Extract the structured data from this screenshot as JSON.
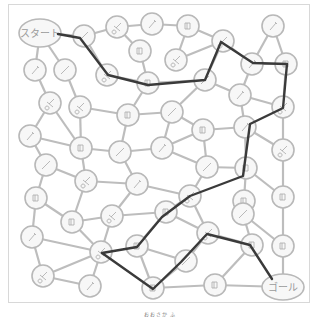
{
  "labels": {
    "start": "スタート",
    "goal": "ゴール",
    "caption": "おおさか ふ"
  },
  "colors": {
    "edge": "#bdbdbd",
    "node_stroke": "#b8b8b8",
    "node_fill": "#f7f7f7",
    "path": "#3a3a3a",
    "label": "#9a9a9a"
  },
  "start_node": {
    "x": 40,
    "y": 33,
    "rx": 21,
    "ry": 14
  },
  "goal_node": {
    "x": 283,
    "y": 287,
    "rx": 21,
    "ry": 13
  },
  "nodes": [
    {
      "id": 0,
      "x": 84,
      "y": 36,
      "icon": "pencil"
    },
    {
      "id": 1,
      "x": 117,
      "y": 27,
      "icon": "scissors"
    },
    {
      "id": 2,
      "x": 152,
      "y": 24,
      "icon": "pen"
    },
    {
      "id": 3,
      "x": 188,
      "y": 26,
      "icon": "book"
    },
    {
      "id": 4,
      "x": 140,
      "y": 51,
      "icon": "book"
    },
    {
      "id": 5,
      "x": 176,
      "y": 60,
      "icon": "scissors"
    },
    {
      "id": 6,
      "x": 223,
      "y": 41,
      "icon": "scissors"
    },
    {
      "id": 7,
      "x": 273,
      "y": 26,
      "icon": "pen"
    },
    {
      "id": 8,
      "x": 252,
      "y": 64,
      "icon": "pen"
    },
    {
      "id": 9,
      "x": 286,
      "y": 64,
      "icon": "book"
    },
    {
      "id": 10,
      "x": 35,
      "y": 70,
      "icon": "pen"
    },
    {
      "id": 11,
      "x": 65,
      "y": 70,
      "icon": "pencil"
    },
    {
      "id": 12,
      "x": 107,
      "y": 75,
      "icon": "scissors"
    },
    {
      "id": 13,
      "x": 148,
      "y": 83,
      "icon": "book"
    },
    {
      "id": 14,
      "x": 205,
      "y": 80,
      "icon": "pencil"
    },
    {
      "id": 15,
      "x": 240,
      "y": 95,
      "icon": "pen"
    },
    {
      "id": 16,
      "x": 283,
      "y": 107,
      "icon": "scissors"
    },
    {
      "id": 17,
      "x": 50,
      "y": 103,
      "icon": "scissors"
    },
    {
      "id": 18,
      "x": 80,
      "y": 107,
      "icon": "scissors"
    },
    {
      "id": 19,
      "x": 128,
      "y": 115,
      "icon": "book"
    },
    {
      "id": 20,
      "x": 172,
      "y": 112,
      "icon": "pencil"
    },
    {
      "id": 21,
      "x": 30,
      "y": 136,
      "icon": "pen"
    },
    {
      "id": 22,
      "x": 81,
      "y": 148,
      "icon": "book"
    },
    {
      "id": 23,
      "x": 120,
      "y": 152,
      "icon": "pencil"
    },
    {
      "id": 24,
      "x": 162,
      "y": 148,
      "icon": "pen"
    },
    {
      "id": 25,
      "x": 203,
      "y": 130,
      "icon": "book"
    },
    {
      "id": 26,
      "x": 245,
      "y": 127,
      "icon": "pen"
    },
    {
      "id": 27,
      "x": 283,
      "y": 150,
      "icon": "scissors"
    },
    {
      "id": 28,
      "x": 46,
      "y": 165,
      "icon": "pencil"
    },
    {
      "id": 29,
      "x": 86,
      "y": 181,
      "icon": "scissors"
    },
    {
      "id": 30,
      "x": 137,
      "y": 184,
      "icon": "pen"
    },
    {
      "id": 31,
      "x": 207,
      "y": 167,
      "icon": "pencil"
    },
    {
      "id": 32,
      "x": 246,
      "y": 168,
      "icon": "book"
    },
    {
      "id": 33,
      "x": 36,
      "y": 198,
      "icon": "book"
    },
    {
      "id": 34,
      "x": 190,
      "y": 196,
      "icon": "scissors"
    },
    {
      "id": 35,
      "x": 244,
      "y": 201,
      "icon": "book"
    },
    {
      "id": 36,
      "x": 283,
      "y": 197,
      "icon": "book"
    },
    {
      "id": 37,
      "x": 72,
      "y": 222,
      "icon": "book"
    },
    {
      "id": 38,
      "x": 112,
      "y": 216,
      "icon": "scissors"
    },
    {
      "id": 39,
      "x": 166,
      "y": 212,
      "icon": "book"
    },
    {
      "id": 40,
      "x": 32,
      "y": 237,
      "icon": "pen"
    },
    {
      "id": 41,
      "x": 101,
      "y": 252,
      "icon": "scissors"
    },
    {
      "id": 42,
      "x": 137,
      "y": 246,
      "icon": "book"
    },
    {
      "id": 43,
      "x": 243,
      "y": 214,
      "icon": "pencil"
    },
    {
      "id": 44,
      "x": 208,
      "y": 233,
      "icon": "scissors"
    },
    {
      "id": 45,
      "x": 252,
      "y": 245,
      "icon": "book"
    },
    {
      "id": 46,
      "x": 186,
      "y": 261,
      "icon": "pencil"
    },
    {
      "id": 47,
      "x": 283,
      "y": 246,
      "icon": "book"
    },
    {
      "id": 48,
      "x": 43,
      "y": 276,
      "icon": "scissors"
    },
    {
      "id": 49,
      "x": 90,
      "y": 286,
      "icon": "pen"
    },
    {
      "id": 50,
      "x": 153,
      "y": 288,
      "icon": "book"
    },
    {
      "id": 51,
      "x": 215,
      "y": 285,
      "icon": "book"
    }
  ],
  "edges": [
    [
      "S",
      0
    ],
    [
      "S",
      10
    ],
    [
      "S",
      11
    ],
    [
      0,
      1
    ],
    [
      1,
      2
    ],
    [
      1,
      4
    ],
    [
      2,
      3
    ],
    [
      3,
      5
    ],
    [
      4,
      13
    ],
    [
      5,
      6
    ],
    [
      6,
      3
    ],
    [
      6,
      8
    ],
    [
      6,
      14
    ],
    [
      7,
      8
    ],
    [
      7,
      9
    ],
    [
      8,
      9
    ],
    [
      8,
      15
    ],
    [
      9,
      16
    ],
    [
      10,
      17
    ],
    [
      11,
      18
    ],
    [
      12,
      0
    ],
    [
      12,
      13
    ],
    [
      13,
      14
    ],
    [
      13,
      19
    ],
    [
      14,
      15
    ],
    [
      14,
      20
    ],
    [
      15,
      16
    ],
    [
      15,
      26
    ],
    [
      16,
      27
    ],
    [
      17,
      21
    ],
    [
      17,
      22
    ],
    [
      18,
      19
    ],
    [
      18,
      22
    ],
    [
      19,
      20
    ],
    [
      19,
      23
    ],
    [
      20,
      24
    ],
    [
      20,
      25
    ],
    [
      21,
      22
    ],
    [
      21,
      28
    ],
    [
      22,
      23
    ],
    [
      22,
      29
    ],
    [
      23,
      24
    ],
    [
      23,
      30
    ],
    [
      24,
      25
    ],
    [
      24,
      31
    ],
    [
      25,
      26
    ],
    [
      25,
      31
    ],
    [
      26,
      32
    ],
    [
      26,
      27
    ],
    [
      27,
      36
    ],
    [
      28,
      29
    ],
    [
      28,
      33
    ],
    [
      29,
      30
    ],
    [
      29,
      37
    ],
    [
      30,
      34
    ],
    [
      30,
      38
    ],
    [
      31,
      34
    ],
    [
      31,
      32
    ],
    [
      32,
      35
    ],
    [
      32,
      36
    ],
    [
      33,
      37
    ],
    [
      33,
      40
    ],
    [
      34,
      39
    ],
    [
      34,
      44
    ],
    [
      35,
      43
    ],
    [
      36,
      47
    ],
    [
      37,
      38
    ],
    [
      37,
      41
    ],
    [
      38,
      39
    ],
    [
      38,
      41
    ],
    [
      39,
      42
    ],
    [
      39,
      44
    ],
    [
      40,
      48
    ],
    [
      40,
      41
    ],
    [
      41,
      49
    ],
    [
      42,
      46
    ],
    [
      42,
      50
    ],
    [
      43,
      45
    ],
    [
      44,
      45
    ],
    [
      44,
      46
    ],
    [
      45,
      51
    ],
    [
      46,
      50
    ],
    [
      47,
      "G"
    ],
    [
      48,
      49
    ],
    [
      48,
      41
    ],
    [
      50,
      51
    ],
    [
      51,
      "G"
    ],
    [
      43,
      47
    ]
  ],
  "solution_path": [
    [
      58,
      34
    ],
    [
      80,
      38
    ],
    [
      108,
      75
    ],
    [
      148,
      85
    ],
    [
      205,
      80
    ],
    [
      221,
      42
    ],
    [
      253,
      63
    ],
    [
      287,
      64
    ],
    [
      283,
      108
    ],
    [
      250,
      124
    ],
    [
      243,
      176
    ],
    [
      190,
      196
    ],
    [
      162,
      217
    ],
    [
      137,
      247
    ],
    [
      102,
      253
    ],
    [
      153,
      289
    ],
    [
      181,
      262
    ],
    [
      207,
      234
    ],
    [
      250,
      245
    ],
    [
      272,
      279
    ]
  ]
}
